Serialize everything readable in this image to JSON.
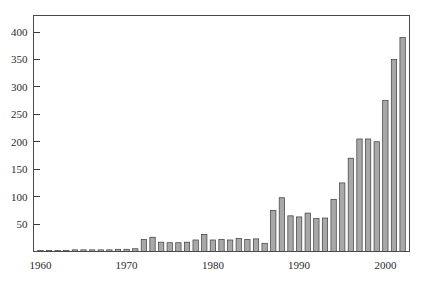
{
  "chart_data": {
    "type": "bar",
    "title": "",
    "subtitle": "",
    "xlabel": "",
    "ylabel": "",
    "grid": false,
    "legend": null,
    "xlim": [
      1959.2,
      2002.8
    ],
    "ylim": [
      0,
      430
    ],
    "y_ticks": [
      50,
      100,
      150,
      200,
      250,
      300,
      350,
      400
    ],
    "y_tick_labels": [
      "50",
      "100",
      "150",
      "200",
      "250",
      "300",
      "350",
      "400"
    ],
    "x_ticks": [
      1960,
      1970,
      1980,
      1990,
      2000
    ],
    "x_tick_labels": [
      "1960",
      "1970",
      "1980",
      "1990",
      "2000"
    ],
    "categories": [
      "1960",
      "1961",
      "1962",
      "1963",
      "1964",
      "1965",
      "1966",
      "1967",
      "1968",
      "1969",
      "1970",
      "1971",
      "1972",
      "1973",
      "1974",
      "1975",
      "1976",
      "1977",
      "1978",
      "1979",
      "1980",
      "1981",
      "1982",
      "1983",
      "1984",
      "1985",
      "1986",
      "1987",
      "1988",
      "1989",
      "1990",
      "1991",
      "1992",
      "1993",
      "1994",
      "1995",
      "1996",
      "1997",
      "1998",
      "1999",
      "2000",
      "2001",
      "2002"
    ],
    "values": [
      2,
      2,
      2,
      2,
      3,
      3,
      3,
      3,
      3,
      4,
      4,
      5,
      22,
      26,
      17,
      16,
      16,
      17,
      21,
      31,
      21,
      22,
      21,
      24,
      22,
      23,
      15,
      75,
      98,
      65,
      63,
      70,
      60,
      61,
      95,
      125,
      170,
      205,
      205,
      200,
      275,
      350,
      390
    ],
    "bar_color": "#a8a8a8",
    "bar_edge_color": "#3c3c3c",
    "axis_color": "#4a4a4a",
    "text_color": "#2a2a2a",
    "background_color": "#ffffff"
  }
}
